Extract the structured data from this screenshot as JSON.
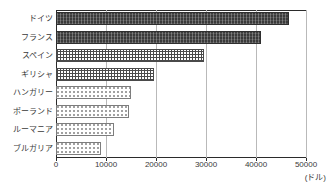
{
  "chart_data": {
    "type": "bar",
    "orientation": "horizontal",
    "title": "",
    "xlabel": "(ドル)",
    "ylabel": "",
    "categories": [
      "ドイツ",
      "フランス",
      "スペイン",
      "ギリシャ",
      "ハンガリー",
      "ポーランド",
      "ルーマニア",
      "ブルガリア"
    ],
    "values": [
      46500,
      41000,
      29500,
      19500,
      15000,
      14500,
      11500,
      9000
    ],
    "xlim": [
      0,
      50000
    ],
    "xticks": [
      0,
      10000,
      20000,
      30000,
      40000,
      50000
    ],
    "xtick_labels": [
      "0",
      "10000",
      "20000",
      "30000",
      "40000",
      "50000"
    ],
    "grid": true,
    "legend": false,
    "bar_patterns": [
      "dark-hatch",
      "dark-hatch",
      "crosshatch",
      "crosshatch",
      "dots",
      "dots",
      "dots",
      "dots"
    ],
    "colors": {
      "dark_fill": "#3a3a3a",
      "grid_stroke": "#4a4a4a",
      "dot_stroke": "#9a9a9a",
      "axis": "#2b2b2b",
      "gridline": "#b9b9b9",
      "text": "#3a3a3a",
      "background": "#ffffff"
    }
  },
  "unit": {
    "label": "(ドル)"
  }
}
